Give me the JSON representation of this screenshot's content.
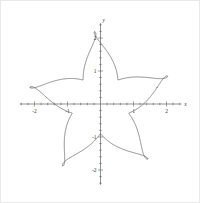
{
  "chart_data": {
    "type": "line",
    "title": "",
    "xlabel": "x",
    "ylabel": "y",
    "xlim": [
      -2.45,
      2.45
    ],
    "ylim": [
      -2.45,
      2.45
    ],
    "grid": false,
    "legend": null,
    "x_ticks": [
      -2,
      -1,
      1,
      2
    ],
    "x_ticklabels": [
      "-2",
      "-1",
      "1",
      "2"
    ],
    "y_ticks": [
      -2,
      -1,
      1,
      2
    ],
    "y_ticklabels": [
      "-2",
      "-1",
      "1",
      "2"
    ],
    "minor_ticks_per_unit": 5,
    "curve": {
      "name": "pinwheel-rose",
      "description": "Closed polar pinwheel curve with 5 hooked spiral arms, self-intersecting loops at each arm tip, max radius about 2.2",
      "arms": 5,
      "r_max": 2.2,
      "r_min": 0.9,
      "sweep": 1.15,
      "points": 2400,
      "color": "#5a5a5a",
      "linewidth": 0.7
    }
  },
  "axis": {
    "x_label": "x",
    "y_label": "y",
    "color": "#4a4a4a"
  },
  "frame": {
    "background": "#ffffff",
    "border_color": "#e9e9e9"
  }
}
